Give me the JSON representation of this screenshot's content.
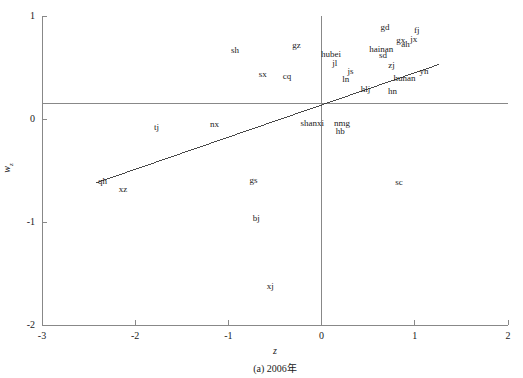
{
  "figure": {
    "caption": "(a) 2006年",
    "axis_color": "#888888",
    "line_color": "#333333",
    "label_color": "#222222"
  },
  "chart_data": {
    "type": "scatter",
    "title": "",
    "subtitle": "",
    "caption": "(a) 2006年",
    "xlabel": "z",
    "ylabel": "w",
    "ylabel_sub": "z",
    "xlim": [
      -3,
      2
    ],
    "ylim": [
      -2,
      1
    ],
    "xticks": [
      -3,
      -2,
      -1,
      0,
      1,
      2
    ],
    "xtick_labels": [
      "-3",
      "-2",
      "-1",
      "0",
      "1",
      "2"
    ],
    "yticks": [
      1,
      0,
      -1,
      -2
    ],
    "ytick_labels": [
      "1",
      "0",
      "-1",
      "-2"
    ],
    "grid": false,
    "legend": "none",
    "reference_lines": [
      {
        "name": "horizontal-mean-line",
        "orientation": "horizontal",
        "value": 0.15
      },
      {
        "name": "vertical-zero-line",
        "orientation": "vertical",
        "value": 0
      }
    ],
    "fit_line": {
      "name": "regression-line",
      "x_start": -2.42,
      "y_start": -0.62,
      "x_end": 1.26,
      "y_end": 0.53
    },
    "points": [
      {
        "label": "sh",
        "x": -0.93,
        "y": 0.67
      },
      {
        "label": "gz",
        "x": -0.27,
        "y": 0.72
      },
      {
        "label": "gd",
        "x": 0.68,
        "y": 0.89
      },
      {
        "label": "fj",
        "x": 1.02,
        "y": 0.86
      },
      {
        "label": "gx",
        "x": 0.85,
        "y": 0.77
      },
      {
        "label": "jx",
        "x": 0.99,
        "y": 0.78
      },
      {
        "label": "ah",
        "x": 0.9,
        "y": 0.73
      },
      {
        "label": "hubei",
        "x": 0.1,
        "y": 0.63
      },
      {
        "label": "hainan",
        "x": 0.64,
        "y": 0.68
      },
      {
        "label": "sd",
        "x": 0.66,
        "y": 0.62
      },
      {
        "label": "jl",
        "x": 0.14,
        "y": 0.54
      },
      {
        "label": "js",
        "x": 0.31,
        "y": 0.47
      },
      {
        "label": "zj",
        "x": 0.75,
        "y": 0.52
      },
      {
        "label": "yn",
        "x": 1.1,
        "y": 0.47
      },
      {
        "label": "sx",
        "x": -0.63,
        "y": 0.44
      },
      {
        "label": "cq",
        "x": -0.37,
        "y": 0.42
      },
      {
        "label": "ln",
        "x": 0.26,
        "y": 0.39
      },
      {
        "label": "hunan",
        "x": 0.89,
        "y": 0.4
      },
      {
        "label": "hlj",
        "x": 0.47,
        "y": 0.29
      },
      {
        "label": "hn",
        "x": 0.76,
        "y": 0.27
      },
      {
        "label": "tj",
        "x": -1.77,
        "y": -0.08
      },
      {
        "label": "nx",
        "x": -1.15,
        "y": -0.05
      },
      {
        "label": "shanxi",
        "x": -0.1,
        "y": -0.04
      },
      {
        "label": "nmg",
        "x": 0.22,
        "y": -0.04
      },
      {
        "label": "hb",
        "x": 0.2,
        "y": -0.12
      },
      {
        "label": "qh",
        "x": -2.35,
        "y": -0.6
      },
      {
        "label": "xz",
        "x": -2.13,
        "y": -0.68
      },
      {
        "label": "gs",
        "x": -0.73,
        "y": -0.59
      },
      {
        "label": "sc",
        "x": 0.83,
        "y": -0.61
      },
      {
        "label": "bj",
        "x": -0.7,
        "y": -0.96
      },
      {
        "label": "xj",
        "x": -0.55,
        "y": -1.62
      }
    ]
  }
}
